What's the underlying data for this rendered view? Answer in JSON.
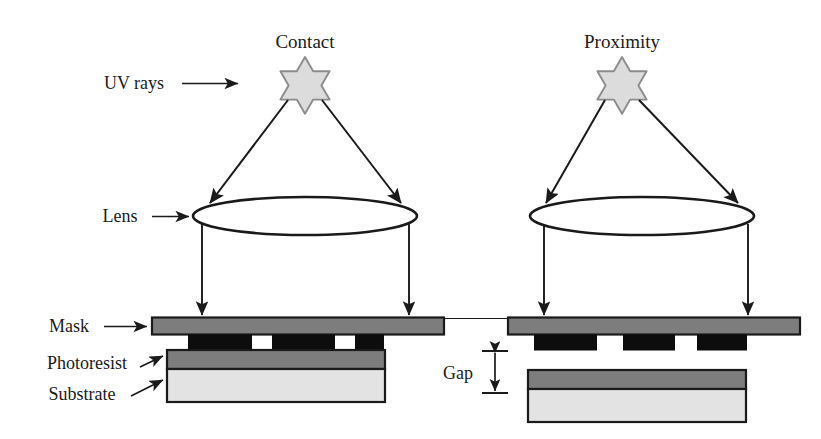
{
  "figure": {
    "title_left": "Contact",
    "title_right": "Proximity",
    "labels": {
      "uv_rays": "UV rays",
      "lens": "Lens",
      "mask": "Mask",
      "photoresist": "Photoresist",
      "substrate": "Substrate",
      "gap": "Gap"
    },
    "arrow_glyph": "⟶",
    "icons": {
      "source": "six-pointed-star-icon",
      "lens": "ellipse-lens-icon",
      "ray": "down-arrow-icon",
      "gap": "double-headed-vertical-arrow-icon"
    },
    "colors": {
      "outline": "#1a1a1a",
      "mask_fill": "#7d7d7d",
      "pattern_fill": "#0d0d0d",
      "photoresist_fill": "#7d7d7d",
      "substrate_fill": "#e3e3e3",
      "star_fill": "#dcdcdc",
      "star_stroke": "#8c8c8c",
      "background": "#ffffff"
    },
    "panels": [
      {
        "name": "contact",
        "title": "Contact",
        "mask_in_contact_with_resist": true,
        "pattern_openings": 2,
        "gap_present": false
      },
      {
        "name": "proximity",
        "title": "Proximity",
        "mask_in_contact_with_resist": false,
        "pattern_blocks": 3,
        "gap_present": true,
        "gap_label": "Gap"
      }
    ]
  }
}
